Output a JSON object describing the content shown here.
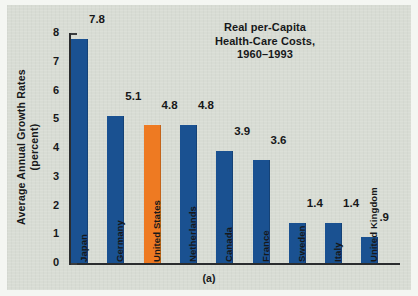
{
  "figure": {
    "caption": "(a)",
    "colors": {
      "bar": "#1a5191",
      "highlight_bar": "#ee7a22",
      "panel_background": "#d8dcd4",
      "text": "#17181a",
      "axis": "#2a2c2e"
    }
  },
  "chart_data": {
    "type": "bar",
    "title": "Real per-Capita Health-Care Costs, 1960–1993",
    "title_lines": [
      "Real per-Capita",
      "Health-Care Costs,",
      "1960–1993"
    ],
    "xlabel": "",
    "ylabel": "Average Annual Growth Rates (percent)",
    "ylabel_lines": [
      "Average Annual Growth Rates",
      "(percent)"
    ],
    "ylim": [
      0,
      8
    ],
    "yticks": [
      0,
      1,
      2,
      3,
      4,
      5,
      6,
      7,
      8
    ],
    "ytick_labels": [
      "0",
      "1",
      "2",
      "3",
      "4",
      "5",
      "6",
      "7",
      "8"
    ],
    "grid": false,
    "legend": null,
    "categories": [
      "Japan",
      "Germany",
      "United States",
      "Netherlands",
      "Canada",
      "France",
      "Sweden",
      "Italy",
      "United Kingdom"
    ],
    "values": [
      7.8,
      5.1,
      4.8,
      4.8,
      3.9,
      3.6,
      1.4,
      1.4,
      0.9
    ],
    "value_labels": [
      "7.8",
      "5.1",
      "4.8",
      "4.8",
      "3.9",
      "3.6",
      "1.4",
      "1.4",
      ".9"
    ],
    "highlight_index": 2,
    "bars": [
      {
        "category": "Japan",
        "value": 7.8,
        "label": "7.8",
        "highlight": false
      },
      {
        "category": "Germany",
        "value": 5.1,
        "label": "5.1",
        "highlight": false
      },
      {
        "category": "United States",
        "value": 4.8,
        "label": "4.8",
        "highlight": true
      },
      {
        "category": "Netherlands",
        "value": 4.8,
        "label": "4.8",
        "highlight": false
      },
      {
        "category": "Canada",
        "value": 3.9,
        "label": "3.9",
        "highlight": false
      },
      {
        "category": "France",
        "value": 3.6,
        "label": "3.6",
        "highlight": false
      },
      {
        "category": "Sweden",
        "value": 1.4,
        "label": "1.4",
        "highlight": false
      },
      {
        "category": "Italy",
        "value": 1.4,
        "label": "1.4",
        "highlight": false
      },
      {
        "category": "United Kingdom",
        "value": 0.9,
        "label": ".9",
        "highlight": false
      }
    ]
  }
}
